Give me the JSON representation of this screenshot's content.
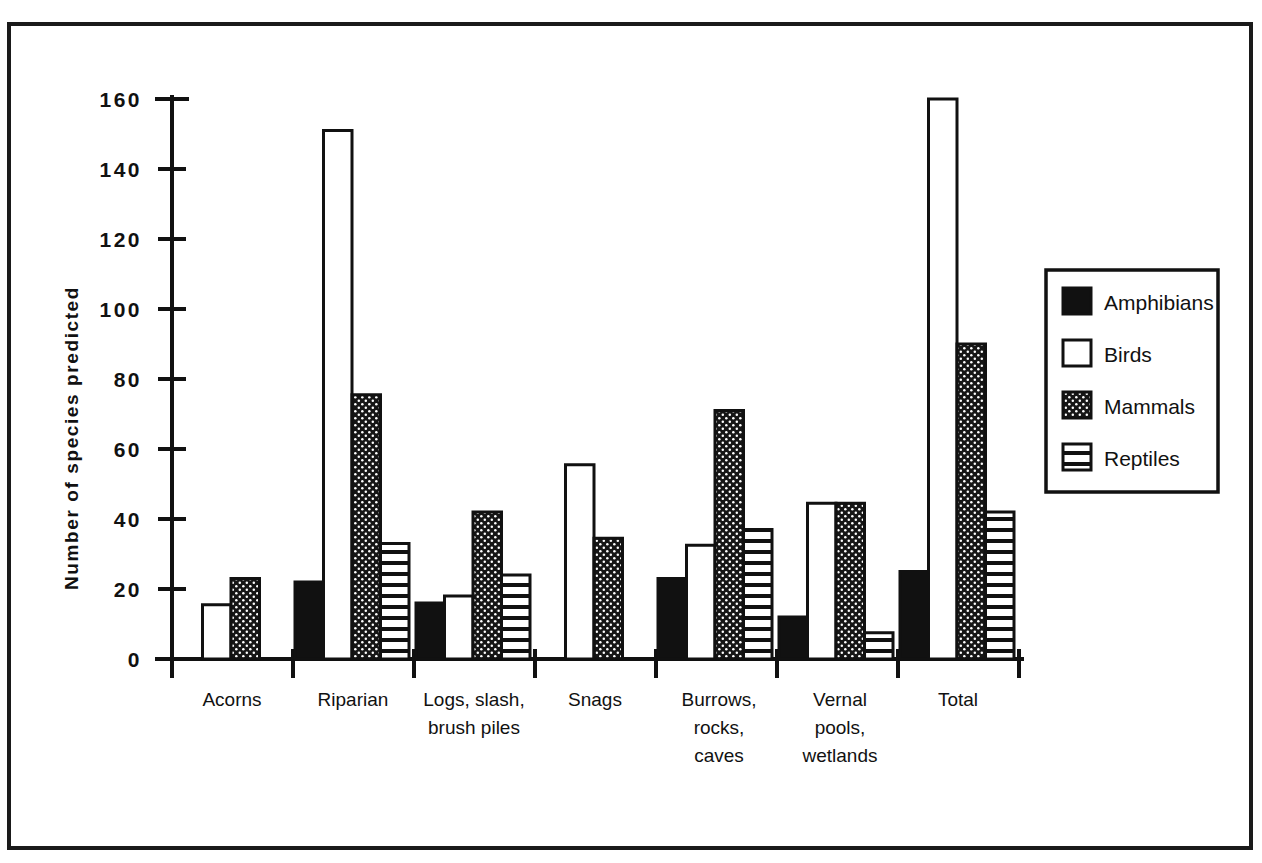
{
  "chart_data": {
    "type": "bar",
    "title": "",
    "xlabel": "",
    "ylabel": "Number of species predicted",
    "ylim": [
      0,
      160
    ],
    "ytick_values": [
      0,
      20,
      40,
      60,
      80,
      100,
      120,
      140,
      160
    ],
    "ytick_labels": [
      "0",
      "20",
      "40",
      "60",
      "80",
      "100",
      "120",
      "140",
      "160"
    ],
    "grid": false,
    "legend_position": "right",
    "categories": [
      "Acorns",
      "Riparian",
      "Logs, slash, brush piles",
      "Snags",
      "Burrows, rocks, caves",
      "Vernal pools, wetlands",
      "Total"
    ],
    "category_lines": [
      [
        "Acorns"
      ],
      [
        "Riparian"
      ],
      [
        "Logs, slash,",
        "brush piles"
      ],
      [
        "Snags"
      ],
      [
        "Burrows,",
        "rocks,",
        "caves"
      ],
      [
        "Vernal",
        "pools,",
        "wetlands"
      ],
      [
        "Total"
      ]
    ],
    "series": [
      {
        "name": "Amphibians",
        "fill": "solid-black",
        "color": "#111111",
        "values": [
          0,
          22,
          16,
          0,
          23,
          12,
          25
        ]
      },
      {
        "name": "Birds",
        "fill": "white",
        "color": "#ffffff",
        "values": [
          15.5,
          151,
          18,
          55.5,
          32.5,
          44.5,
          160
        ]
      },
      {
        "name": "Mammals",
        "fill": "stipple",
        "color": "#1c1c1c",
        "values": [
          23,
          75.5,
          42,
          34.5,
          71,
          44.5,
          90
        ]
      },
      {
        "name": "Reptiles",
        "fill": "horizontal-stripes",
        "color": "#ffffff",
        "values": [
          0,
          33,
          24,
          0,
          37,
          7.5,
          42
        ]
      }
    ]
  },
  "legend": {
    "entries": [
      {
        "label": "Amphibians",
        "swatch": "solid-black"
      },
      {
        "label": "Birds",
        "swatch": "white"
      },
      {
        "label": "Mammals",
        "swatch": "stipple"
      },
      {
        "label": "Reptiles",
        "swatch": "horizontal-stripes"
      }
    ]
  },
  "axes": {
    "y_title": "Number of species predicted"
  }
}
